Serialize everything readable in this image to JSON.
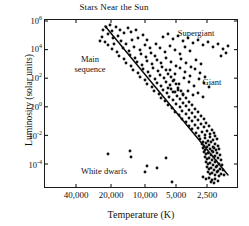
{
  "chart_data": {
    "type": "scatter",
    "title": "Stars Near the Sun",
    "xlabel": "Temperature (K)",
    "ylabel": "Luminosity (solar units)",
    "x_tick_labels": [
      "40,000",
      "20,000",
      "10,000",
      "5,000",
      "2,500"
    ],
    "x_tick_values": [
      40000,
      20000,
      10000,
      5000,
      2500
    ],
    "x_axis_direction": "reversed",
    "x_scale": "log",
    "y_tick_labels": [
      "10⁶",
      "10⁴",
      "10²",
      "10⁰",
      "10⁻²",
      "10⁻⁴"
    ],
    "y_tick_exponents": [
      6,
      4,
      2,
      0,
      -2,
      -4
    ],
    "y_scale": "log",
    "ylim": [
      -5.3,
      6.0
    ],
    "grid": false,
    "legend": "none",
    "annotations": [
      {
        "text": "Main\nsequence",
        "x_px": 90,
        "y_px": 60
      },
      {
        "text": "Supergiant",
        "x_px": 196,
        "y_px": 33
      },
      {
        "text": "Giant",
        "x_px": 212,
        "y_px": 82
      },
      {
        "text": "White dwarfs",
        "x_px": 104,
        "y_px": 171
      }
    ],
    "main_sequence_line": {
      "x1_px": 105,
      "y1_px": 26,
      "x2_px": 228,
      "y2_px": 175,
      "description": "straight line through main sequence band"
    },
    "points_px": [
      [
        106,
        27
      ],
      [
        110,
        25
      ],
      [
        103,
        30
      ],
      [
        112,
        31
      ],
      [
        108,
        34
      ],
      [
        102,
        37
      ],
      [
        116,
        27
      ],
      [
        120,
        30
      ],
      [
        100,
        41
      ],
      [
        105,
        42
      ],
      [
        113,
        38
      ],
      [
        118,
        36
      ],
      [
        124,
        33
      ],
      [
        128,
        28
      ],
      [
        131,
        32
      ],
      [
        136,
        30
      ],
      [
        108,
        45
      ],
      [
        114,
        44
      ],
      [
        121,
        41
      ],
      [
        126,
        44
      ],
      [
        132,
        40
      ],
      [
        138,
        38
      ],
      [
        143,
        35
      ],
      [
        147,
        40
      ],
      [
        112,
        49
      ],
      [
        117,
        52
      ],
      [
        123,
        48
      ],
      [
        129,
        51
      ],
      [
        134,
        47
      ],
      [
        140,
        50
      ],
      [
        145,
        45
      ],
      [
        150,
        48
      ],
      [
        119,
        56
      ],
      [
        124,
        59
      ],
      [
        130,
        55
      ],
      [
        135,
        58
      ],
      [
        141,
        54
      ],
      [
        146,
        57
      ],
      [
        151,
        53
      ],
      [
        155,
        56
      ],
      [
        126,
        63
      ],
      [
        131,
        66
      ],
      [
        137,
        62
      ],
      [
        142,
        65
      ],
      [
        147,
        61
      ],
      [
        152,
        64
      ],
      [
        157,
        60
      ],
      [
        161,
        63
      ],
      [
        133,
        70
      ],
      [
        138,
        73
      ],
      [
        143,
        69
      ],
      [
        148,
        72
      ],
      [
        153,
        68
      ],
      [
        158,
        71
      ],
      [
        162,
        67
      ],
      [
        166,
        70
      ],
      [
        140,
        77
      ],
      [
        145,
        80
      ],
      [
        150,
        76
      ],
      [
        155,
        79
      ],
      [
        160,
        75
      ],
      [
        164,
        78
      ],
      [
        168,
        74
      ],
      [
        171,
        77
      ],
      [
        147,
        84
      ],
      [
        152,
        87
      ],
      [
        157,
        83
      ],
      [
        161,
        86
      ],
      [
        166,
        82
      ],
      [
        170,
        85
      ],
      [
        173,
        81
      ],
      [
        176,
        84
      ],
      [
        154,
        91
      ],
      [
        159,
        94
      ],
      [
        163,
        90
      ],
      [
        167,
        93
      ],
      [
        171,
        89
      ],
      [
        175,
        92
      ],
      [
        178,
        88
      ],
      [
        181,
        91
      ],
      [
        161,
        98
      ],
      [
        165,
        101
      ],
      [
        169,
        97
      ],
      [
        173,
        100
      ],
      [
        177,
        96
      ],
      [
        180,
        99
      ],
      [
        183,
        95
      ],
      [
        186,
        98
      ],
      [
        168,
        105
      ],
      [
        172,
        108
      ],
      [
        176,
        104
      ],
      [
        180,
        107
      ],
      [
        183,
        103
      ],
      [
        186,
        106
      ],
      [
        189,
        102
      ],
      [
        192,
        105
      ],
      [
        175,
        112
      ],
      [
        179,
        115
      ],
      [
        182,
        111
      ],
      [
        186,
        114
      ],
      [
        189,
        110
      ],
      [
        192,
        113
      ],
      [
        195,
        109
      ],
      [
        198,
        112
      ],
      [
        182,
        119
      ],
      [
        186,
        122
      ],
      [
        189,
        118
      ],
      [
        192,
        121
      ],
      [
        195,
        117
      ],
      [
        198,
        120
      ],
      [
        201,
        116
      ],
      [
        204,
        119
      ],
      [
        189,
        126
      ],
      [
        192,
        129
      ],
      [
        195,
        125
      ],
      [
        198,
        128
      ],
      [
        201,
        124
      ],
      [
        204,
        127
      ],
      [
        206,
        123
      ],
      [
        209,
        126
      ],
      [
        196,
        133
      ],
      [
        199,
        136
      ],
      [
        202,
        132
      ],
      [
        205,
        135
      ],
      [
        207,
        131
      ],
      [
        210,
        134
      ],
      [
        212,
        130
      ],
      [
        214,
        133
      ],
      [
        200,
        139
      ],
      [
        203,
        142
      ],
      [
        205,
        138
      ],
      [
        208,
        141
      ],
      [
        210,
        137
      ],
      [
        213,
        140
      ],
      [
        215,
        136
      ],
      [
        217,
        139
      ],
      [
        202,
        144
      ],
      [
        204,
        146
      ],
      [
        206,
        143
      ],
      [
        209,
        145
      ],
      [
        211,
        142
      ],
      [
        213,
        147
      ],
      [
        215,
        144
      ],
      [
        218,
        146
      ],
      [
        203,
        148
      ],
      [
        205,
        150
      ],
      [
        207,
        147
      ],
      [
        210,
        149
      ],
      [
        212,
        151
      ],
      [
        214,
        148
      ],
      [
        216,
        150
      ],
      [
        219,
        149
      ],
      [
        204,
        152
      ],
      [
        206,
        154
      ],
      [
        208,
        153
      ],
      [
        211,
        155
      ],
      [
        213,
        152
      ],
      [
        215,
        156
      ],
      [
        217,
        153
      ],
      [
        220,
        155
      ],
      [
        205,
        157
      ],
      [
        207,
        159
      ],
      [
        209,
        158
      ],
      [
        212,
        160
      ],
      [
        214,
        157
      ],
      [
        216,
        161
      ],
      [
        218,
        158
      ],
      [
        221,
        160
      ],
      [
        206,
        162
      ],
      [
        208,
        164
      ],
      [
        210,
        163
      ],
      [
        213,
        165
      ],
      [
        215,
        162
      ],
      [
        217,
        166
      ],
      [
        219,
        164
      ],
      [
        222,
        165
      ],
      [
        207,
        167
      ],
      [
        209,
        169
      ],
      [
        211,
        168
      ],
      [
        214,
        170
      ],
      [
        216,
        167
      ],
      [
        218,
        171
      ],
      [
        220,
        169
      ],
      [
        223,
        170
      ],
      [
        208,
        172
      ],
      [
        210,
        174
      ],
      [
        212,
        173
      ],
      [
        215,
        175
      ],
      [
        217,
        172
      ],
      [
        219,
        176
      ],
      [
        221,
        174
      ],
      [
        224,
        175
      ],
      [
        203,
        177
      ],
      [
        206,
        179
      ],
      [
        209,
        178
      ],
      [
        212,
        180
      ],
      [
        215,
        179
      ],
      [
        218,
        181
      ],
      [
        211,
        182
      ],
      [
        214,
        183
      ],
      [
        163,
        37
      ],
      [
        168,
        34
      ],
      [
        173,
        39
      ],
      [
        178,
        36
      ],
      [
        183,
        41
      ],
      [
        188,
        38
      ],
      [
        193,
        43
      ],
      [
        198,
        40
      ],
      [
        203,
        45
      ],
      [
        208,
        42
      ],
      [
        213,
        47
      ],
      [
        218,
        44
      ],
      [
        223,
        49
      ],
      [
        228,
        46
      ],
      [
        226,
        53
      ],
      [
        221,
        56
      ],
      [
        156,
        44
      ],
      [
        160,
        48
      ],
      [
        165,
        52
      ],
      [
        170,
        46
      ],
      [
        175,
        50
      ],
      [
        180,
        54
      ],
      [
        185,
        47
      ],
      [
        190,
        51
      ],
      [
        166,
        58
      ],
      [
        171,
        62
      ],
      [
        176,
        66
      ],
      [
        181,
        59
      ],
      [
        186,
        63
      ],
      [
        191,
        67
      ],
      [
        196,
        60
      ],
      [
        201,
        64
      ],
      [
        170,
        70
      ],
      [
        175,
        74
      ],
      [
        180,
        68
      ],
      [
        185,
        72
      ],
      [
        190,
        76
      ],
      [
        195,
        69
      ],
      [
        200,
        73
      ],
      [
        205,
        77
      ],
      [
        174,
        80
      ],
      [
        179,
        84
      ],
      [
        184,
        78
      ],
      [
        189,
        82
      ],
      [
        194,
        86
      ],
      [
        199,
        79
      ],
      [
        204,
        83
      ],
      [
        209,
        87
      ],
      [
        168,
        88
      ],
      [
        173,
        92
      ],
      [
        178,
        90
      ],
      [
        183,
        94
      ],
      [
        188,
        91
      ],
      [
        193,
        95
      ],
      [
        198,
        93
      ],
      [
        203,
        97
      ],
      [
        108,
        154
      ],
      [
        130,
        151
      ],
      [
        131,
        157
      ],
      [
        147,
        166
      ],
      [
        157,
        168
      ],
      [
        166,
        158
      ],
      [
        172,
        182
      ],
      [
        145,
        172
      ]
    ]
  }
}
